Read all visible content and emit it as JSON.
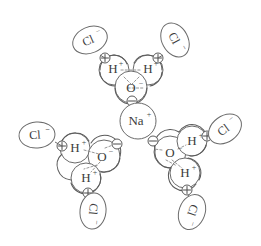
{
  "figure": {
    "background_color": "#ffffff",
    "stroke_color": "#5b5b5b",
    "label_color": "#3c3c3c",
    "dash_color": "#8a8a8a"
  },
  "labels": {
    "hydrogen": "H",
    "oxygen": "O",
    "chloride": "Cl",
    "sodium": "Na",
    "plus_sup": "+",
    "minus_sup": "−",
    "delta_plus": "⊕",
    "delta_minus": "⊖"
  },
  "central_ion": {
    "name": "sodium-ion",
    "symbol": "Na",
    "charge": "+",
    "charge_sign": "positive",
    "shape": "circle",
    "cx": 138,
    "cy": 121,
    "r": 18
  },
  "water_molecules": [
    {
      "id": "water-top",
      "name": "water-molecule-top",
      "rotation_deg": 0,
      "center": {
        "x": 131,
        "y": 72
      },
      "atoms": [
        {
          "symbol": "H",
          "role": "hydrogen-left",
          "partial_charge": "⊕",
          "x": 114,
          "y": 70
        },
        {
          "symbol": "H",
          "role": "hydrogen-right",
          "partial_charge": "⊕",
          "x": 148,
          "y": 70
        },
        {
          "symbol": "O",
          "role": "oxygen",
          "partial_charge": "⊖",
          "x": 131,
          "y": 88
        }
      ]
    },
    {
      "id": "water-bottom-left",
      "name": "water-molecule-bottom-left",
      "rotation_deg": 120,
      "center": {
        "x": 89,
        "y": 159
      },
      "atoms": [
        {
          "symbol": "H",
          "role": "hydrogen-left",
          "partial_charge": "⊕",
          "x": 75,
          "y": 148
        },
        {
          "symbol": "O",
          "role": "oxygen",
          "partial_charge": "⊖",
          "x": 97,
          "y": 159
        },
        {
          "symbol": "H",
          "role": "hydrogen-bottom",
          "partial_charge": "⊕",
          "x": 86,
          "y": 180
        }
      ]
    },
    {
      "id": "water-bottom-right",
      "name": "water-molecule-bottom-right",
      "rotation_deg": 240,
      "center": {
        "x": 182,
        "y": 159
      },
      "atoms": [
        {
          "symbol": "O",
          "role": "oxygen",
          "partial_charge": "⊖",
          "x": 171,
          "y": 151
        },
        {
          "symbol": "H",
          "role": "hydrogen-top",
          "partial_charge": "⊕",
          "x": 192,
          "y": 142
        },
        {
          "symbol": "H",
          "role": "hydrogen-bottom",
          "partial_charge": "⊕",
          "x": 186,
          "y": 174
        }
      ]
    }
  ],
  "chloride_ions": [
    {
      "id": "cl-top-left",
      "name": "chloride-ion-top-left",
      "symbol": "Cl",
      "charge": "−",
      "cx": 90,
      "cy": 40,
      "rx": 18,
      "ry": 13,
      "rotation_deg": -24
    },
    {
      "id": "cl-top-right",
      "name": "chloride-ion-top-right",
      "symbol": "Cl",
      "charge": "−",
      "cx": 175,
      "cy": 40,
      "rx": 18,
      "ry": 13,
      "rotation_deg": 62
    },
    {
      "id": "cl-left",
      "name": "chloride-ion-left",
      "symbol": "Cl",
      "charge": "−",
      "cx": 37,
      "cy": 135,
      "rx": 18,
      "ry": 13,
      "rotation_deg": -4
    },
    {
      "id": "cl-bottom-left",
      "name": "chloride-ion-bottom-left",
      "symbol": "Cl",
      "charge": "−",
      "cx": 93,
      "cy": 211,
      "rx": 13,
      "ry": 18,
      "rotation_deg": 96
    },
    {
      "id": "cl-right",
      "name": "chloride-ion-right",
      "symbol": "Cl",
      "charge": "−",
      "cx": 225,
      "cy": 129,
      "rx": 18,
      "ry": 13,
      "rotation_deg": -36
    },
    {
      "id": "cl-bottom-right",
      "name": "chloride-ion-bottom-right",
      "symbol": "Cl",
      "charge": "−",
      "cx": 192,
      "cy": 212,
      "rx": 13,
      "ry": 18,
      "rotation_deg": 110
    }
  ],
  "partial_charges": [
    {
      "id": "pc-top-left",
      "name": "partial-charge-positive-top-left",
      "sign": "+",
      "cx": 105,
      "cy": 58,
      "r": 5
    },
    {
      "id": "pc-top-right",
      "name": "partial-charge-positive-top-right",
      "sign": "+",
      "cx": 158,
      "cy": 58,
      "r": 5
    },
    {
      "id": "pc-top-oxygen",
      "name": "partial-charge-negative-top-oxygen",
      "sign": "-",
      "cx": 132,
      "cy": 101,
      "r": 5
    },
    {
      "id": "pc-bl-h1",
      "name": "partial-charge-positive-bottom-left-h1",
      "sign": "+",
      "cx": 62,
      "cy": 146,
      "r": 5
    },
    {
      "id": "pc-bl-o",
      "name": "partial-charge-negative-bottom-left-oxygen",
      "sign": "-",
      "cx": 116,
      "cy": 144,
      "r": 5
    },
    {
      "id": "pc-bl-h2",
      "name": "partial-charge-positive-bottom-left-h2",
      "sign": "+",
      "cx": 87,
      "cy": 193,
      "r": 5
    },
    {
      "id": "pc-br-o",
      "name": "partial-charge-negative-bottom-right-oxygen",
      "sign": "-",
      "cx": 155,
      "cy": 141,
      "r": 5
    },
    {
      "id": "pc-br-h1",
      "name": "partial-charge-positive-bottom-right-h1",
      "sign": "+",
      "cx": 206,
      "cy": 137,
      "r": 5
    },
    {
      "id": "pc-br-h2",
      "name": "partial-charge-positive-bottom-right-h2",
      "sign": "+",
      "cx": 187,
      "cy": 190,
      "r": 5
    }
  ]
}
